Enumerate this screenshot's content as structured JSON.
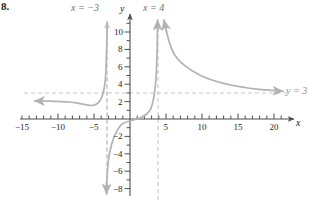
{
  "problem": {
    "number": "8."
  },
  "axes": {
    "x_axis_label": "x",
    "y_axis_label": "y",
    "x_ticks": [
      {
        "value": -15,
        "label": "−15"
      },
      {
        "value": -10,
        "label": "−10"
      },
      {
        "value": -5,
        "label": "−5"
      },
      {
        "value": 5,
        "label": "5"
      },
      {
        "value": 10,
        "label": "10"
      },
      {
        "value": 15,
        "label": "15"
      },
      {
        "value": 20,
        "label": "20"
      }
    ],
    "y_ticks": [
      {
        "value": 10,
        "label": "10"
      },
      {
        "value": 8,
        "label": "8"
      },
      {
        "value": 6,
        "label": "6"
      },
      {
        "value": 4,
        "label": "4"
      },
      {
        "value": 2,
        "label": "2"
      },
      {
        "value": -2,
        "label": "−2"
      },
      {
        "value": -4,
        "label": "−4"
      },
      {
        "value": -6,
        "label": "−6"
      },
      {
        "value": -8,
        "label": "−8"
      }
    ]
  },
  "annotations": {
    "vertical_asymptote_left": "x = −3",
    "vertical_asymptote_right": "x = 4",
    "horizontal_asymptote": "y = 3"
  },
  "colors": {
    "curve": "#b3b3b5",
    "asymptote": "#c7c7c9",
    "axis": "#4d4e50",
    "text": "#231f20",
    "label_gray": "#75767a",
    "background": "#ffffff"
  },
  "chart_data": {
    "type": "line",
    "title": "",
    "xlabel": "x",
    "ylabel": "y",
    "xlim": [
      -15,
      20
    ],
    "ylim": [
      -8,
      11
    ],
    "grid": false,
    "legend": "none",
    "asymptotes": {
      "vertical": [
        -3,
        4
      ],
      "horizontal": [
        3
      ]
    },
    "series": [
      {
        "name": "left-branch",
        "comment": "x < -3; approaches y=3 from below as x -> -infinity, rises to +infinity as x -> -3 from the left",
        "arrow_ends": [
          "left-end-at-y-approx-2.2",
          "top-at-x=-3"
        ],
        "points": [
          [
            -15.0,
            2.25
          ],
          [
            -13.0,
            2.22
          ],
          [
            -11.0,
            2.18
          ],
          [
            -9.0,
            2.12
          ],
          [
            -7.5,
            2.05
          ],
          [
            -6.5,
            1.95
          ],
          [
            -5.5,
            1.8
          ],
          [
            -4.8,
            1.65
          ],
          [
            -4.2,
            1.55
          ],
          [
            -3.8,
            1.7
          ],
          [
            -3.5,
            2.4
          ],
          [
            -3.35,
            3.6
          ],
          [
            -3.25,
            5.2
          ],
          [
            -3.18,
            7.2
          ],
          [
            -3.12,
            9.4
          ],
          [
            -3.08,
            11.0
          ]
        ]
      },
      {
        "name": "middle-branch",
        "comment": "-3 < x < 4; falls to -infinity near x=-3 from the right and rises to +infinity near x=4 from the left",
        "arrow_ends": [
          "bottom-at-x=-3",
          "top-at-x=4"
        ],
        "points": [
          [
            -2.92,
            -8.0
          ],
          [
            -2.88,
            -6.2
          ],
          [
            -2.82,
            -4.6
          ],
          [
            -2.72,
            -3.3
          ],
          [
            -2.55,
            -2.3
          ],
          [
            -2.3,
            -1.55
          ],
          [
            -1.9,
            -0.95
          ],
          [
            -1.4,
            -0.55
          ],
          [
            -0.8,
            -0.28
          ],
          [
            0.0,
            -0.1
          ],
          [
            0.8,
            0.05
          ],
          [
            1.5,
            0.3
          ],
          [
            2.1,
            0.7
          ],
          [
            2.6,
            1.3
          ],
          [
            3.0,
            2.2
          ],
          [
            3.3,
            3.4
          ],
          [
            3.55,
            5.0
          ],
          [
            3.72,
            7.0
          ],
          [
            3.84,
            9.2
          ],
          [
            3.9,
            11.0
          ]
        ]
      },
      {
        "name": "right-branch",
        "comment": "x > 4; comes down from +infinity near x=4 and approaches y=3 from above as x -> +infinity",
        "arrow_ends": [
          "top-at-x=4",
          "right-end-at-y-approx-3.3"
        ],
        "points": [
          [
            4.2,
            11.0
          ],
          [
            4.35,
            9.4
          ],
          [
            4.55,
            8.0
          ],
          [
            4.85,
            6.8
          ],
          [
            5.3,
            5.9
          ],
          [
            5.9,
            5.2
          ],
          [
            6.8,
            4.7
          ],
          [
            8.0,
            4.3
          ],
          [
            9.5,
            4.0
          ],
          [
            11.5,
            3.75
          ],
          [
            13.5,
            3.58
          ],
          [
            15.5,
            3.47
          ],
          [
            17.5,
            3.4
          ],
          [
            19.5,
            3.35
          ],
          [
            20.0,
            3.34
          ]
        ]
      }
    ]
  }
}
